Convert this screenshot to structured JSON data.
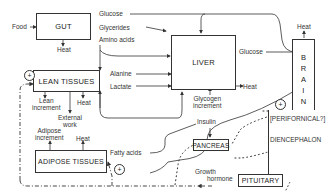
{
  "diagram": {
    "boxes": {
      "gut": "GUT",
      "liver": "LIVER",
      "brain": [
        "B",
        "R",
        "A",
        "I",
        "N"
      ],
      "lean": "LEAN TISSUES",
      "adipose": "ADIPOSE TISSUES",
      "pancreas": "PANCREAS",
      "pituitary": "PITUITARY",
      "diencephalon": "DIENCEPHALON",
      "perifornical": "[PERIFORNICAL?]"
    },
    "labels": {
      "food": "Food",
      "gut_heat": "Heat",
      "glucose_top": "Glucose",
      "glycerides": "Glycerides",
      "amino_acids": "Amino acids",
      "alanine": "Alanine",
      "lactate": "Lactate",
      "liver_glucose": "Glucose",
      "liver_heat": "Heat",
      "glycogen_1": "Glycogen",
      "glycogen_2": "increment",
      "brain_heat": "Heat",
      "lean_inc_1": "Lean",
      "lean_inc_2": "increment",
      "lean_heat": "Heat",
      "ext_work_1": "External",
      "ext_work_2": "work",
      "adipose_inc_1": "Adipose",
      "adipose_inc_2": "increment",
      "adipose_heat": "Heat",
      "fatty_acids": "Fatty acids",
      "insulin": "Insulin",
      "growth_1": "Growth",
      "growth_2": "hormone"
    },
    "signs": {
      "lean": "+",
      "adipose": "+",
      "brain": "+"
    }
  }
}
